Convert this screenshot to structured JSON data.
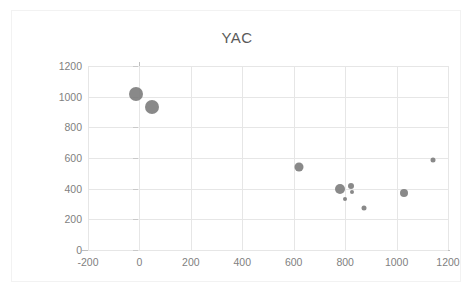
{
  "chart_data": {
    "type": "scatter",
    "title": "YAC",
    "xlabel": "",
    "ylabel": "",
    "xlim": [
      -200,
      1200
    ],
    "ylim": [
      0,
      1200
    ],
    "xticks": [
      -200,
      0,
      200,
      400,
      600,
      800,
      1000,
      1200
    ],
    "yticks": [
      0,
      200,
      400,
      600,
      800,
      1000,
      1200
    ],
    "grid": true,
    "legend": "none",
    "marker_color": "#7f7f7f",
    "series": [
      {
        "name": "YAC",
        "points": [
          {
            "x": -15,
            "y": 1020,
            "size": 14
          },
          {
            "x": 50,
            "y": 935,
            "size": 14
          },
          {
            "x": 620,
            "y": 540,
            "size": 9
          },
          {
            "x": 780,
            "y": 395,
            "size": 10
          },
          {
            "x": 822,
            "y": 415,
            "size": 6
          },
          {
            "x": 826,
            "y": 378,
            "size": 4
          },
          {
            "x": 800,
            "y": 330,
            "size": 4
          },
          {
            "x": 875,
            "y": 275,
            "size": 5
          },
          {
            "x": 1030,
            "y": 372,
            "size": 8
          },
          {
            "x": 1140,
            "y": 588,
            "size": 5
          }
        ]
      }
    ]
  }
}
